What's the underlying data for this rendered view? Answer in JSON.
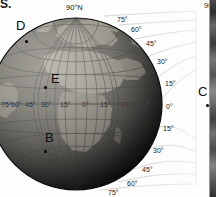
{
  "figure": {
    "type": "orthographic-globe-graticule",
    "pole_label": "90°N",
    "fragment_top_left": "S.",
    "fragment_top_right": "90",
    "globe": {
      "center_x": 76,
      "center_y": 104,
      "radius": 86,
      "center_longitude": "0°",
      "center_latitude": "0°",
      "grid_spacing_degrees": 15
    },
    "equator_longitude_labels": [
      {
        "text": "75°",
        "x": 1,
        "y": 104
      },
      {
        "text": "60°",
        "x": 11,
        "y": 104
      },
      {
        "text": "45°",
        "x": 24,
        "y": 104
      },
      {
        "text": "30°",
        "x": 40,
        "y": 104
      },
      {
        "text": "15°",
        "x": 60,
        "y": 104
      },
      {
        "text": "0°",
        "x": 82,
        "y": 104
      },
      {
        "text": "15°",
        "x": 100,
        "y": 104
      },
      {
        "text": "30°",
        "x": 120,
        "y": 104
      },
      {
        "text": "45°",
        "x": 139,
        "y": 104
      }
    ],
    "right_latitude_labels": [
      {
        "text": "75°",
        "x": 117,
        "y": 19
      },
      {
        "text": "60°",
        "x": 131,
        "y": 29
      },
      {
        "text": "45°",
        "x": 146,
        "y": 43
      },
      {
        "text": "30°",
        "x": 157,
        "y": 61
      },
      {
        "text": "15°",
        "x": 165,
        "y": 83
      },
      {
        "text": "0°",
        "x": 166,
        "y": 106
      },
      {
        "text": "15°",
        "x": 163,
        "y": 128
      },
      {
        "text": "30°",
        "x": 153,
        "y": 150
      },
      {
        "text": "45°",
        "x": 142,
        "y": 169
      },
      {
        "text": "60°",
        "x": 127,
        "y": 183
      },
      {
        "text": "75°",
        "x": 108,
        "y": 192
      }
    ],
    "points": [
      {
        "label": "D",
        "label_x": 16,
        "label_y": 26,
        "dot_x": 26,
        "dot_y": 41
      },
      {
        "label": "E",
        "label_x": 51,
        "label_y": 79,
        "dot_x": 45,
        "dot_y": 87
      },
      {
        "label": "B",
        "label_x": 46,
        "label_y": 138,
        "dot_x": 45,
        "dot_y": 151
      },
      {
        "label": "C",
        "label_x": 199,
        "label_y": 92,
        "dot_x": 207,
        "dot_y": 105
      }
    ],
    "colors": {
      "background": "#ffffff",
      "ocean_light": "#8d8d8d",
      "ocean_dark": "#1a1a1a",
      "land_light": "#c9c4bb",
      "graticule": "#3a3a3a",
      "outer_graticule": "#d3d3d3",
      "label_text": "#111111",
      "marker": "#000000"
    }
  }
}
